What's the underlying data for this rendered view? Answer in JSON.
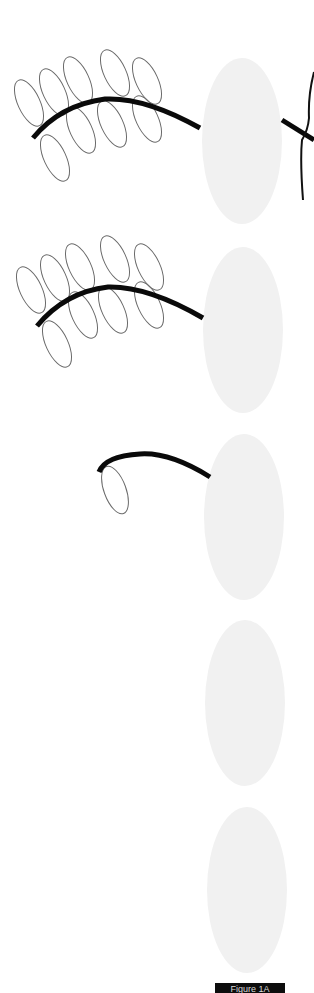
{
  "figure": {
    "colors": {
      "background": "#ffffff",
      "stem": "#0a0a0a",
      "leaflet_outline": "#6a6a6a",
      "oval_body": "#f1f1f1",
      "label_box": "#0d0d0d"
    },
    "panels": [
      {
        "index": 1,
        "leaflet_count": 9,
        "has_side_crossing": true
      },
      {
        "index": 2,
        "leaflet_count": 9,
        "has_side_crossing": false
      },
      {
        "index": 3,
        "leaflet_count": 1,
        "has_side_crossing": false
      },
      {
        "index": 4,
        "leaflet_count": 0,
        "has_side_crossing": false
      },
      {
        "index": 5,
        "leaflet_count": 0,
        "has_side_crossing": false
      }
    ],
    "label": "Figure 1A"
  }
}
